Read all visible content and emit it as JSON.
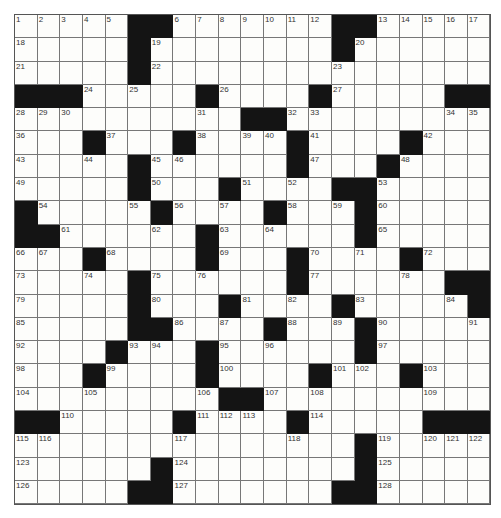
{
  "puzzle": {
    "rows": 21,
    "cols": 21,
    "black_color": "#141414",
    "grid": [
      [
        "1",
        "2",
        "3",
        "4",
        "5",
        "#",
        "#",
        "6",
        "7",
        "8",
        "9",
        "10",
        "11",
        "12",
        "#",
        "#",
        "13",
        "14",
        "15",
        "16",
        "17"
      ],
      [
        "18",
        "",
        "",
        "",
        "",
        "#",
        "19",
        "",
        "",
        "",
        "",
        "",
        "",
        "",
        "#",
        "20",
        "",
        "",
        "",
        "",
        ""
      ],
      [
        "21",
        "",
        "",
        "",
        "",
        "#",
        "22",
        "",
        "",
        "",
        "",
        "",
        "",
        "",
        "23",
        "",
        "",
        "",
        "",
        "",
        ""
      ],
      [
        "#",
        "#",
        "#",
        "24",
        "",
        "25",
        "",
        "",
        "#",
        "26",
        "",
        "",
        "",
        "#",
        "27",
        "",
        "",
        "",
        "",
        "#",
        "#"
      ],
      [
        "28",
        "29",
        "30",
        "",
        "",
        "",
        "",
        "",
        "31",
        "",
        "#",
        "#",
        "32",
        "33",
        "",
        "",
        "",
        "",
        "",
        "34",
        "35"
      ],
      [
        "36",
        "",
        "",
        "#",
        "37",
        "",
        "",
        "#",
        "38",
        "",
        "39",
        "40",
        "#",
        "41",
        "",
        "",
        "",
        "#",
        "42",
        "",
        ""
      ],
      [
        "43",
        "",
        "",
        "44",
        "",
        "#",
        "45",
        "46",
        "",
        "",
        "",
        "",
        "#",
        "47",
        "",
        "",
        "#",
        "48",
        "",
        "",
        ""
      ],
      [
        "49",
        "",
        "",
        "",
        "",
        "#",
        "50",
        "",
        "",
        "#",
        "51",
        "",
        "52",
        "",
        "#",
        "#",
        "53",
        "",
        "",
        "",
        ""
      ],
      [
        "#",
        "54",
        "",
        "",
        "",
        "55",
        "#",
        "56",
        "",
        "57",
        "",
        "#",
        "58",
        "",
        "59",
        "#",
        "60",
        "",
        "",
        "",
        ""
      ],
      [
        "#",
        "#",
        "61",
        "",
        "",
        "",
        "62",
        "",
        "#",
        "63",
        "",
        "64",
        "",
        "",
        "",
        "#",
        "65",
        "",
        "",
        "",
        ""
      ],
      [
        "66",
        "67",
        "",
        "#",
        "68",
        "",
        "",
        "",
        "#",
        "69",
        "",
        "",
        "#",
        "70",
        "",
        "71",
        "",
        "#",
        "72",
        "",
        ""
      ],
      [
        "73",
        "",
        "",
        "74",
        "",
        "#",
        "75",
        "",
        "76",
        "",
        "",
        "",
        "#",
        "77",
        "",
        "",
        "",
        "78",
        "",
        "#",
        "#"
      ],
      [
        "79",
        "",
        "",
        "",
        "",
        "#",
        "80",
        "",
        "",
        "#",
        "81",
        "",
        "82",
        "",
        "#",
        "83",
        "",
        "",
        "",
        "84",
        "#"
      ],
      [
        "85",
        "",
        "",
        "",
        "",
        "#",
        "#",
        "86",
        "",
        "87",
        "",
        "#",
        "88",
        "",
        "89",
        "#",
        "90",
        "",
        "",
        "",
        "91"
      ],
      [
        "92",
        "",
        "",
        "",
        "#",
        "93",
        "94",
        "",
        "#",
        "95",
        "",
        "96",
        "",
        "",
        "",
        "#",
        "97",
        "",
        "",
        "",
        ""
      ],
      [
        "98",
        "",
        "",
        "#",
        "99",
        "",
        "",
        "",
        "#",
        "100",
        "",
        "",
        "",
        "#",
        "101",
        "102",
        "",
        "#",
        "103",
        "",
        ""
      ],
      [
        "104",
        "",
        "",
        "105",
        "",
        "",
        "",
        "",
        "106",
        "#",
        "#",
        "107",
        "",
        "108",
        "",
        "",
        "",
        "",
        "109",
        "",
        ""
      ],
      [
        "#",
        "#",
        "110",
        "",
        "",
        "",
        "",
        "#",
        "111",
        "112",
        "113",
        "",
        "#",
        "114",
        "",
        "",
        "",
        "",
        "#",
        "#",
        "#"
      ],
      [
        "115",
        "116",
        "",
        "",
        "",
        "",
        "",
        "117",
        "",
        "",
        "",
        "",
        "118",
        "",
        "",
        "#",
        "119",
        "",
        "120",
        "121",
        "122"
      ],
      [
        "123",
        "",
        "",
        "",
        "",
        "",
        "#",
        "124",
        "",
        "",
        "",
        "",
        "",
        "",
        "",
        "#",
        "125",
        "",
        "",
        "",
        ""
      ],
      [
        "126",
        "",
        "",
        "",
        "",
        "#",
        "#",
        "127",
        "",
        "",
        "",
        "",
        "",
        "",
        "#",
        "#",
        "128",
        "",
        "",
        "",
        ""
      ]
    ]
  }
}
